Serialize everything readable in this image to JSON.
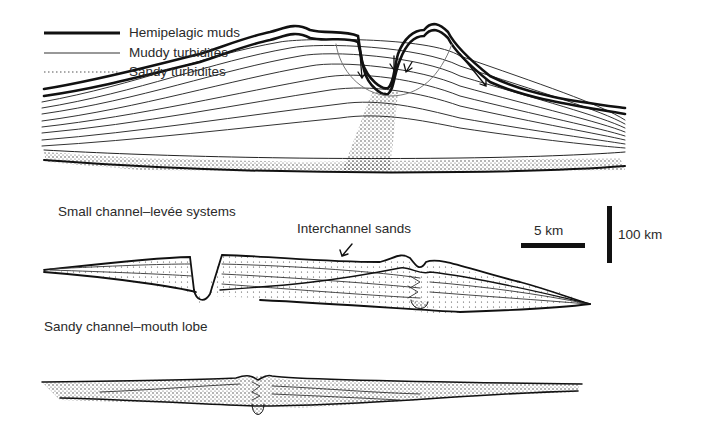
{
  "legend": {
    "items": [
      {
        "label": "Hemipelagic muds",
        "style": "thick-line"
      },
      {
        "label": "Muddy turbidites",
        "style": "thin-line"
      },
      {
        "label": "Sandy turbidites",
        "style": "dotted-line"
      }
    ]
  },
  "sections": [
    {
      "id": "large-channel-levee",
      "title": ""
    },
    {
      "id": "small-channel-levee",
      "title": "Small channel–levée systems",
      "annotation": "Interchannel sands"
    },
    {
      "id": "sandy-channel-mouth-lobe",
      "title": "Sandy channel–mouth lobe"
    }
  ],
  "scale": {
    "horizontal": "5 km",
    "vertical": "100 km"
  },
  "colors": {
    "ink": "#1a1a1a",
    "background": "#ffffff"
  }
}
